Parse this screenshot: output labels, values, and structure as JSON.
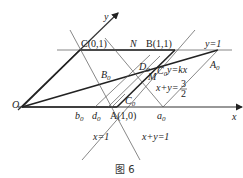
{
  "figure": {
    "caption": "图 6",
    "axes": {
      "x_label": "x",
      "y_label": "y",
      "origin_label": "O"
    },
    "points": {
      "C": "C(0,1)",
      "B": "B(1,1)",
      "A": "A(1,0)",
      "N": "N",
      "B0": "B",
      "B0_sub": "0",
      "D0": "D",
      "D0_sub": "0",
      "C0_upper": "C",
      "C0_upper_sub": "0",
      "C0_lower": "C",
      "C0_lower_sub": "0",
      "M": "M",
      "A0": "A",
      "A0_sub": "0",
      "a0": "a",
      "a0_sub": "0",
      "b0": "b",
      "b0_sub": "0",
      "d0": "d",
      "d0_sub": "0"
    },
    "lines": {
      "y1": "y=1",
      "ykx": "y=kx",
      "x1": "x=1",
      "xy1": "x+y=1",
      "xy32_prefix": "x+y=",
      "xy32_num": "3",
      "xy32_den": "2"
    }
  }
}
